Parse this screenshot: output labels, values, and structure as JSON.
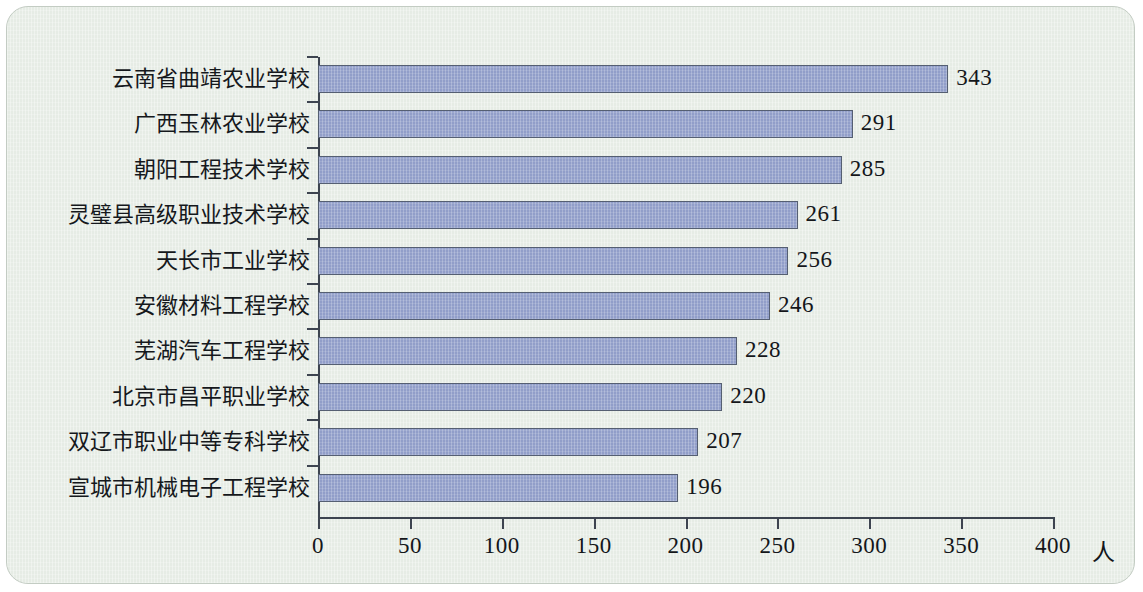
{
  "chart_data": {
    "type": "bar",
    "orientation": "horizontal",
    "title": "",
    "subtitle": "",
    "xlabel": "",
    "ylabel": "",
    "unit_label": "人",
    "xlim": [
      0,
      400
    ],
    "xticks": [
      0,
      50,
      100,
      150,
      200,
      250,
      300,
      350,
      400
    ],
    "xtick_labels": [
      "0",
      "50",
      "100",
      "150",
      "200",
      "250",
      "300",
      "350",
      "400"
    ],
    "grid": false,
    "legend": false,
    "categories": [
      "云南省曲靖农业学校",
      "广西玉林农业学校",
      "朝阳工程技术学校",
      "灵璧县高级职业技术学校",
      "天长市工业学校",
      "安徽材料工程学校",
      "芜湖汽车工程学校",
      "北京市昌平职业学校",
      "双辽市职业中等专科学校",
      "宣城市机械电子工程学校"
    ],
    "values": [
      343,
      291,
      285,
      261,
      256,
      246,
      228,
      220,
      207,
      196
    ],
    "value_labels": [
      "343",
      "291",
      "285",
      "261",
      "256",
      "246",
      "228",
      "220",
      "207",
      "196"
    ],
    "colors": {
      "bar_fill": "#919ec9",
      "bar_border": "#555f72",
      "background": "#e6ece5",
      "frame_border": "#c3ccc3",
      "axis": "#3d4450",
      "text": "#14161a"
    }
  }
}
